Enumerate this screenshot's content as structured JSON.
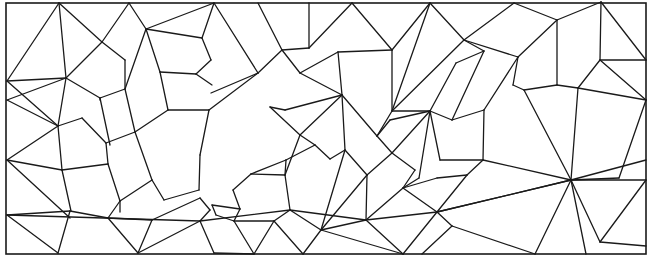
{
  "diagram": {
    "type": "polygonal-mesh",
    "stroke_color": "#1a1a1a",
    "background": "#ffffff",
    "border": {
      "x": 6,
      "y": 3,
      "w": 640,
      "h": 251
    },
    "edges": [
      [
        59,
        3,
        7,
        81
      ],
      [
        59,
        3,
        66,
        78
      ],
      [
        59,
        3,
        102,
        42
      ],
      [
        129,
        3,
        102,
        42
      ],
      [
        129,
        3,
        146,
        29
      ],
      [
        214,
        3,
        146,
        29
      ],
      [
        214,
        3,
        202,
        38
      ],
      [
        214,
        3,
        258,
        73
      ],
      [
        7,
        81,
        66,
        78
      ],
      [
        7,
        81,
        58,
        126
      ],
      [
        66,
        78,
        102,
        42
      ],
      [
        66,
        78,
        58,
        126
      ],
      [
        66,
        78,
        100,
        98
      ],
      [
        102,
        42,
        125,
        60
      ],
      [
        125,
        60,
        125,
        89
      ],
      [
        125,
        89,
        100,
        98
      ],
      [
        146,
        29,
        125,
        89
      ],
      [
        146,
        29,
        160,
        72
      ],
      [
        146,
        29,
        202,
        38
      ],
      [
        202,
        38,
        211,
        60
      ],
      [
        211,
        60,
        196,
        74
      ],
      [
        196,
        74,
        160,
        72
      ],
      [
        125,
        89,
        135,
        132
      ],
      [
        100,
        98,
        110,
        145
      ],
      [
        100,
        98,
        100,
        100
      ],
      [
        160,
        72,
        168,
        110
      ],
      [
        168,
        110,
        135,
        132
      ],
      [
        196,
        74,
        212,
        85
      ],
      [
        58,
        126,
        82,
        118
      ],
      [
        82,
        118,
        106,
        143
      ],
      [
        58,
        126,
        62,
        170
      ],
      [
        7,
        160,
        58,
        126
      ],
      [
        7,
        160,
        62,
        170
      ],
      [
        7,
        160,
        70,
        218
      ],
      [
        62,
        170,
        108,
        164
      ],
      [
        62,
        170,
        71,
        211
      ],
      [
        108,
        164,
        120,
        201
      ],
      [
        135,
        132,
        152,
        180
      ],
      [
        106,
        143,
        108,
        164
      ],
      [
        106,
        143,
        135,
        132
      ],
      [
        152,
        180,
        164,
        200
      ],
      [
        164,
        200,
        199,
        190
      ],
      [
        199,
        190,
        200,
        155
      ],
      [
        200,
        155,
        209,
        110
      ],
      [
        168,
        110,
        209,
        110
      ],
      [
        209,
        110,
        258,
        73
      ],
      [
        152,
        180,
        120,
        201
      ],
      [
        120,
        201,
        120,
        212
      ],
      [
        7,
        215,
        70,
        211
      ],
      [
        7,
        215,
        58,
        253
      ],
      [
        70,
        211,
        58,
        253
      ],
      [
        70,
        211,
        108,
        218
      ],
      [
        108,
        218,
        138,
        253
      ],
      [
        108,
        218,
        152,
        220
      ],
      [
        152,
        220,
        138,
        253
      ],
      [
        108,
        218,
        120,
        201
      ],
      [
        152,
        220,
        200,
        198
      ],
      [
        200,
        198,
        210,
        210
      ],
      [
        210,
        210,
        200,
        221
      ],
      [
        200,
        221,
        214,
        253
      ],
      [
        200,
        221,
        138,
        253
      ],
      [
        258,
        73,
        282,
        50
      ],
      [
        258,
        73,
        211,
        93
      ],
      [
        282,
        50,
        258,
        3
      ],
      [
        282,
        50,
        309,
        48
      ],
      [
        282,
        50,
        300,
        73
      ],
      [
        300,
        73,
        338,
        52
      ],
      [
        309,
        3,
        309,
        48
      ],
      [
        309,
        48,
        352,
        3
      ],
      [
        352,
        3,
        392,
        50
      ],
      [
        392,
        50,
        338,
        52
      ],
      [
        392,
        50,
        430,
        3
      ],
      [
        392,
        50,
        392,
        111
      ],
      [
        338,
        52,
        342,
        95
      ],
      [
        342,
        95,
        300,
        73
      ],
      [
        342,
        95,
        285,
        110
      ],
      [
        285,
        110,
        270,
        107
      ],
      [
        270,
        107,
        300,
        135
      ],
      [
        300,
        135,
        342,
        95
      ],
      [
        342,
        95,
        377,
        136
      ],
      [
        377,
        136,
        392,
        111
      ],
      [
        392,
        111,
        430,
        3
      ],
      [
        430,
        3,
        464,
        40
      ],
      [
        464,
        40,
        392,
        111
      ],
      [
        464,
        40,
        514,
        3
      ],
      [
        514,
        3,
        557,
        20
      ],
      [
        557,
        20,
        518,
        57
      ],
      [
        518,
        57,
        464,
        40
      ],
      [
        464,
        40,
        484,
        51
      ],
      [
        484,
        51,
        456,
        63
      ],
      [
        456,
        63,
        430,
        111
      ],
      [
        430,
        111,
        392,
        111
      ],
      [
        430,
        111,
        452,
        120
      ],
      [
        452,
        120,
        484,
        51
      ],
      [
        430,
        111,
        390,
        120
      ],
      [
        390,
        120,
        377,
        136
      ],
      [
        300,
        135,
        315,
        145
      ],
      [
        315,
        145,
        286,
        160
      ],
      [
        286,
        160,
        285,
        175
      ],
      [
        285,
        175,
        300,
        135
      ],
      [
        342,
        95,
        345,
        150
      ],
      [
        345,
        150,
        330,
        159
      ],
      [
        330,
        159,
        315,
        145
      ],
      [
        345,
        150,
        367,
        175
      ],
      [
        367,
        175,
        392,
        153
      ],
      [
        392,
        153,
        377,
        136
      ],
      [
        392,
        153,
        430,
        111
      ],
      [
        392,
        153,
        415,
        170
      ],
      [
        415,
        170,
        403,
        188
      ],
      [
        286,
        160,
        251,
        174
      ],
      [
        251,
        174,
        233,
        190
      ],
      [
        233,
        190,
        240,
        209
      ],
      [
        240,
        209,
        234,
        221
      ],
      [
        234,
        221,
        216,
        215
      ],
      [
        216,
        215,
        212,
        205
      ],
      [
        212,
        205,
        240,
        209
      ],
      [
        251,
        174,
        285,
        175
      ],
      [
        285,
        175,
        290,
        210
      ],
      [
        290,
        210,
        274,
        221
      ],
      [
        274,
        221,
        234,
        221
      ],
      [
        290,
        210,
        321,
        230
      ],
      [
        321,
        230,
        345,
        150
      ],
      [
        321,
        230,
        367,
        175
      ],
      [
        367,
        175,
        366,
        220
      ],
      [
        366,
        220,
        321,
        230
      ],
      [
        366,
        220,
        403,
        188
      ],
      [
        403,
        188,
        419,
        178
      ],
      [
        419,
        178,
        430,
        111
      ],
      [
        403,
        188,
        437,
        178
      ],
      [
        437,
        178,
        467,
        175
      ],
      [
        467,
        175,
        483,
        160
      ],
      [
        483,
        160,
        440,
        160
      ],
      [
        440,
        160,
        430,
        111
      ],
      [
        483,
        160,
        484,
        110
      ],
      [
        484,
        110,
        452,
        120
      ],
      [
        484,
        110,
        518,
        57
      ],
      [
        518,
        57,
        513,
        85
      ],
      [
        513,
        85,
        524,
        90
      ],
      [
        524,
        90,
        571,
        180
      ],
      [
        557,
        20,
        557,
        85
      ],
      [
        557,
        85,
        524,
        90
      ],
      [
        557,
        85,
        578,
        88
      ],
      [
        578,
        88,
        600,
        60
      ],
      [
        600,
        60,
        601,
        2
      ],
      [
        601,
        2,
        557,
        20
      ],
      [
        600,
        60,
        646,
        60
      ],
      [
        646,
        60,
        601,
        2
      ],
      [
        600,
        60,
        646,
        100
      ],
      [
        646,
        100,
        578,
        88
      ],
      [
        578,
        88,
        571,
        180
      ],
      [
        571,
        180,
        619,
        178
      ],
      [
        619,
        178,
        646,
        100
      ],
      [
        571,
        180,
        646,
        180
      ],
      [
        571,
        180,
        600,
        242
      ],
      [
        600,
        242,
        646,
        180
      ],
      [
        571,
        180,
        586,
        254
      ],
      [
        571,
        180,
        535,
        254
      ],
      [
        571,
        180,
        483,
        160
      ],
      [
        571,
        180,
        437,
        212
      ],
      [
        437,
        212,
        403,
        188
      ],
      [
        437,
        212,
        467,
        175
      ],
      [
        437,
        212,
        452,
        226
      ],
      [
        452,
        226,
        422,
        254
      ],
      [
        452,
        226,
        535,
        254
      ],
      [
        437,
        212,
        403,
        254
      ],
      [
        403,
        254,
        366,
        220
      ],
      [
        403,
        254,
        321,
        230
      ],
      [
        321,
        230,
        303,
        254
      ],
      [
        303,
        254,
        274,
        221
      ],
      [
        274,
        221,
        254,
        254
      ],
      [
        254,
        254,
        234,
        221
      ],
      [
        254,
        254,
        214,
        253
      ],
      [
        600,
        242,
        646,
        246
      ],
      [
        7,
        215,
        200,
        221
      ],
      [
        200,
        221,
        290,
        210
      ],
      [
        290,
        210,
        366,
        220
      ],
      [
        366,
        220,
        437,
        212
      ],
      [
        437,
        212,
        571,
        180
      ],
      [
        571,
        180,
        646,
        160
      ],
      [
        7,
        100,
        58,
        126
      ],
      [
        7,
        100,
        66,
        78
      ]
    ]
  }
}
